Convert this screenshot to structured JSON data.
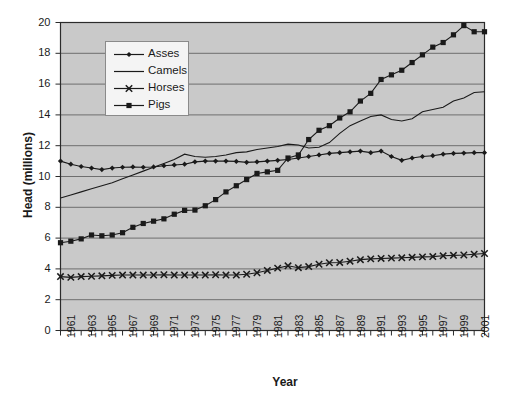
{
  "chart_data": {
    "type": "line",
    "title": "",
    "xlabel": "Year",
    "ylabel": "Head (millions)",
    "xlim": [
      1961,
      2002
    ],
    "ylim": [
      0,
      20
    ],
    "ytick_step": 2,
    "yticks": [
      0,
      2,
      4,
      6,
      8,
      10,
      12,
      14,
      16,
      18,
      20
    ],
    "grid": "horizontal",
    "legend_position": "upper-left-inside",
    "plot_bgcolor": "#c9c9c9",
    "gridline_color": "#6e6e6e",
    "series_color": "#1a1a1a",
    "x": [
      1961,
      1962,
      1963,
      1964,
      1965,
      1966,
      1967,
      1968,
      1969,
      1970,
      1971,
      1972,
      1973,
      1974,
      1975,
      1976,
      1977,
      1978,
      1979,
      1980,
      1981,
      1982,
      1983,
      1984,
      1985,
      1986,
      1987,
      1988,
      1989,
      1990,
      1991,
      1992,
      1993,
      1994,
      1995,
      1996,
      1997,
      1998,
      1999,
      2000,
      2001,
      2002
    ],
    "xtick_labels": [
      "1961",
      "",
      "1963",
      "",
      "1965",
      "",
      "1967",
      "",
      "1969",
      "",
      "1971",
      "",
      "1973",
      "",
      "1975",
      "",
      "1977",
      "",
      "1979",
      "",
      "1981",
      "",
      "1983",
      "",
      "1985",
      "",
      "1987",
      "",
      "1989",
      "",
      "1991",
      "",
      "1993",
      "",
      "1995",
      "",
      "1997",
      "",
      "1999",
      "",
      "2001",
      ""
    ],
    "series": [
      {
        "name": "Asses",
        "marker": "filled-diamond",
        "line": "solid",
        "values": [
          11.0,
          10.8,
          10.65,
          10.55,
          10.45,
          10.55,
          10.6,
          10.62,
          10.6,
          10.62,
          10.7,
          10.75,
          10.8,
          10.95,
          11.0,
          11.0,
          11.0,
          10.98,
          10.92,
          10.95,
          11.0,
          11.05,
          11.1,
          11.2,
          11.3,
          11.4,
          11.5,
          11.55,
          11.6,
          11.65,
          11.55,
          11.65,
          11.3,
          11.05,
          11.2,
          11.3,
          11.35,
          11.45,
          11.5,
          11.52,
          11.55,
          11.55
        ]
      },
      {
        "name": "Camels",
        "marker": "none",
        "line": "solid",
        "values": [
          8.6,
          8.8,
          9.0,
          9.2,
          9.4,
          9.6,
          9.85,
          10.1,
          10.35,
          10.6,
          10.85,
          11.1,
          11.45,
          11.3,
          11.25,
          11.3,
          11.4,
          11.55,
          11.6,
          11.75,
          11.85,
          11.95,
          12.1,
          12.05,
          11.85,
          11.9,
          12.2,
          12.8,
          13.3,
          13.6,
          13.9,
          14.0,
          13.7,
          13.6,
          13.75,
          14.2,
          14.35,
          14.5,
          14.9,
          15.1,
          15.45,
          15.5
        ]
      },
      {
        "name": "Horses",
        "marker": "x-cross",
        "line": "solid",
        "values": [
          3.5,
          3.45,
          3.5,
          3.52,
          3.55,
          3.58,
          3.6,
          3.6,
          3.6,
          3.6,
          3.62,
          3.6,
          3.6,
          3.6,
          3.6,
          3.62,
          3.6,
          3.6,
          3.65,
          3.75,
          3.9,
          4.05,
          4.2,
          4.08,
          4.15,
          4.3,
          4.4,
          4.42,
          4.5,
          4.6,
          4.65,
          4.68,
          4.7,
          4.72,
          4.75,
          4.78,
          4.8,
          4.85,
          4.88,
          4.9,
          4.95,
          5.0
        ]
      },
      {
        "name": "Pigs",
        "marker": "filled-square",
        "line": "solid",
        "values": [
          5.7,
          5.8,
          5.95,
          6.2,
          6.15,
          6.2,
          6.35,
          6.7,
          6.95,
          7.1,
          7.25,
          7.55,
          7.8,
          7.82,
          8.1,
          8.5,
          9.0,
          9.4,
          9.8,
          10.2,
          10.3,
          10.4,
          11.2,
          11.4,
          12.4,
          13.0,
          13.3,
          13.8,
          14.2,
          14.9,
          15.4,
          16.3,
          16.6,
          16.9,
          17.4,
          17.9,
          18.4,
          18.7,
          19.2,
          19.8,
          19.4,
          19.4
        ]
      }
    ]
  },
  "legend": {
    "items": [
      {
        "label": "Asses",
        "marker": "filled-diamond"
      },
      {
        "label": "Camels",
        "marker": "none"
      },
      {
        "label": "Horses",
        "marker": "x-cross"
      },
      {
        "label": "Pigs",
        "marker": "filled-square"
      }
    ]
  }
}
